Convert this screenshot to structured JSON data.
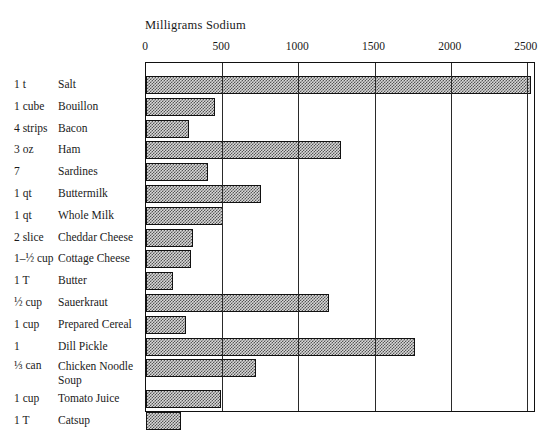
{
  "chart_data": {
    "type": "bar",
    "orientation": "horizontal",
    "title": "Milligrams Sodium",
    "xlabel": "Milligrams Sodium",
    "ylabel": "",
    "xlim": [
      0,
      2560
    ],
    "xticks": [
      0,
      500,
      1000,
      1500,
      2000,
      2500
    ],
    "xtick_labels": [
      "0",
      "500",
      "1000",
      "1500",
      "2000",
      "2500"
    ],
    "grid": "vertical gridlines at each 500 mg tick",
    "legend": "none",
    "categories": [
      "Salt",
      "Bouillon",
      "Bacon",
      "Ham",
      "Sardines",
      "Buttermilk",
      "Whole Milk",
      "Cheddar Cheese",
      "Cottage Cheese",
      "Butter",
      "Sauerkraut",
      "Prepared Cereal",
      "Dill Pickle",
      "Chicken Noodle Soup",
      "Tomato Juice",
      "Catsup"
    ],
    "values": [
      2530,
      450,
      285,
      1280,
      410,
      755,
      505,
      310,
      295,
      175,
      1200,
      265,
      1765,
      720,
      490,
      230
    ],
    "quantities": [
      "1 t",
      "1 cube",
      "4 strips",
      "3 oz",
      "7",
      "1 qt",
      "1 qt",
      "2 slice",
      "1–½ cup",
      "1 T",
      "½ cup",
      "1 cup",
      "1",
      "⅓ can",
      "1 cup",
      "1 T"
    ],
    "bar_fill": "#d8d8d8",
    "bar_edge": "#111111"
  },
  "rows": [
    {
      "qty": "1 t",
      "name": "Salt",
      "value": 2530
    },
    {
      "qty": "1 cube",
      "name": "Bouillon",
      "value": 450
    },
    {
      "qty": "4 strips",
      "name": "Bacon",
      "value": 285
    },
    {
      "qty": "3 oz",
      "name": "Ham",
      "value": 1280
    },
    {
      "qty": "7",
      "name": "Sardines",
      "value": 410
    },
    {
      "qty": "1 qt",
      "name": "Buttermilk",
      "value": 755
    },
    {
      "qty": "1 qt",
      "name": "Whole Milk",
      "value": 505
    },
    {
      "qty": "2 slice",
      "name": "Cheddar Cheese",
      "value": 310
    },
    {
      "qty": "1–½ cup",
      "name": "Cottage Cheese",
      "value": 295
    },
    {
      "qty": "1 T",
      "name": "Butter",
      "value": 175
    },
    {
      "qty": "½ cup",
      "name": "Sauerkraut",
      "value": 1200
    },
    {
      "qty": "1 cup",
      "name": "Prepared Cereal",
      "value": 265
    },
    {
      "qty": "1",
      "name": "Dill Pickle",
      "value": 1765
    },
    {
      "qty": "⅓ can",
      "name": "Chicken Noodle\nSoup",
      "value": 720
    },
    {
      "qty": "1 cup",
      "name": "Tomato Juice",
      "value": 490
    },
    {
      "qty": "1 T",
      "name": "Catsup",
      "value": 230
    }
  ]
}
